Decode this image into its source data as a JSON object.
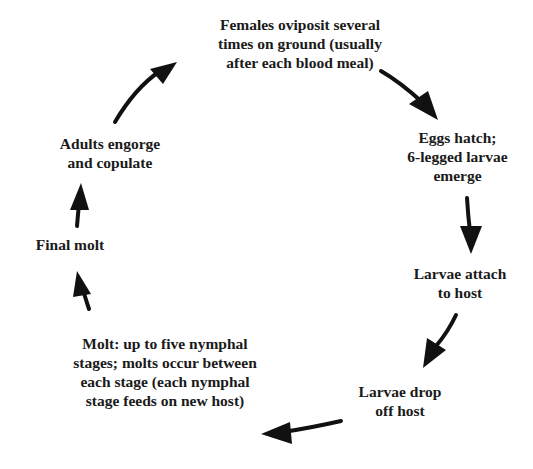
{
  "diagram": {
    "stages": [
      {
        "id": "oviposit",
        "lines": [
          "Females oviposit several",
          "times on ground (usually",
          "after each blood meal)"
        ]
      },
      {
        "id": "eggs-hatch",
        "lines": [
          "Eggs hatch;",
          "6-legged larvae",
          "emerge"
        ]
      },
      {
        "id": "larvae-attach",
        "lines": [
          "Larvae attach",
          "to host"
        ]
      },
      {
        "id": "larvae-drop",
        "lines": [
          "Larvae drop",
          "off host"
        ]
      },
      {
        "id": "nymphal-molt",
        "lines": [
          "Molt: up to five nymphal",
          "stages; molts occur between",
          "each stage (each nymphal",
          "stage feeds on new host)"
        ]
      },
      {
        "id": "final-molt",
        "lines": [
          "Final molt"
        ]
      },
      {
        "id": "adults-engorge",
        "lines": [
          "Adults engorge",
          "and copulate"
        ]
      }
    ],
    "cycle_direction": "clockwise",
    "ink_color": "#111111"
  }
}
